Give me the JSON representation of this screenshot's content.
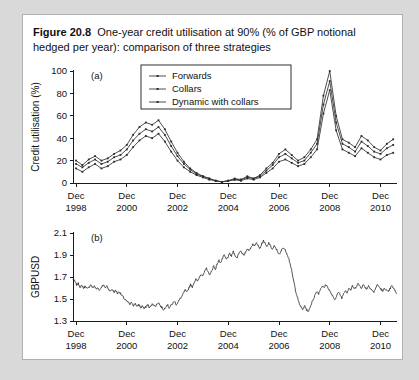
{
  "figure": {
    "label": "Figure 20.8",
    "caption": "One-year credit utilisation at 90% (% of GBP notional hedged per year): comparison of three strategies"
  },
  "chart_data": [
    {
      "type": "line",
      "panel_tag": "(a)",
      "title": "One-year credit utilisation at 90%",
      "xlabel": "",
      "ylabel": "Credit utilisation (%)",
      "ylim": [
        0,
        100
      ],
      "yticks": [
        0,
        20,
        40,
        60,
        80,
        100
      ],
      "xlim": [
        "Dec 1998",
        "Dec 2011"
      ],
      "xticks": [
        "Dec 1998",
        "Dec 2000",
        "Dec 2002",
        "Dec 2004",
        "Dec 2006",
        "Dec 2008",
        "Dec 2010"
      ],
      "xtick_years": [
        1998,
        2000,
        2002,
        2004,
        2006,
        2008,
        2010
      ],
      "grid": false,
      "legend_position": "upper-center",
      "markers": true,
      "x": [
        1998.95,
        1999.2,
        1999.45,
        1999.7,
        1999.95,
        2000.2,
        2000.45,
        2000.7,
        2000.95,
        2001.2,
        2001.45,
        2001.7,
        2001.95,
        2002.2,
        2002.45,
        2002.7,
        2002.95,
        2003.2,
        2003.45,
        2003.7,
        2003.95,
        2004.2,
        2004.45,
        2004.7,
        2004.95,
        2005.2,
        2005.45,
        2005.7,
        2005.95,
        2006.2,
        2006.45,
        2006.7,
        2006.95,
        2007.2,
        2007.45,
        2007.7,
        2007.95,
        2008.2,
        2008.45,
        2008.7,
        2008.95,
        2009.2,
        2009.45,
        2009.7,
        2009.95,
        2010.2,
        2010.45,
        2010.7,
        2010.95,
        2011.2,
        2011.45
      ],
      "series": [
        {
          "name": "Forwards",
          "values": [
            13,
            10,
            14,
            17,
            13,
            15,
            19,
            21,
            25,
            32,
            38,
            42,
            40,
            44,
            37,
            28,
            20,
            14,
            10,
            7,
            5,
            3,
            2,
            1,
            2,
            3,
            2,
            4,
            3,
            5,
            9,
            13,
            19,
            21,
            18,
            15,
            17,
            23,
            30,
            62,
            83,
            47,
            30,
            27,
            24,
            31,
            27,
            23,
            21,
            25,
            27
          ]
        },
        {
          "name": "Collars",
          "values": [
            17,
            14,
            18,
            21,
            17,
            19,
            23,
            25,
            30,
            38,
            44,
            48,
            46,
            50,
            43,
            33,
            24,
            17,
            12,
            8,
            6,
            4,
            2,
            1,
            2,
            3,
            3,
            5,
            4,
            6,
            11,
            16,
            23,
            26,
            22,
            18,
            20,
            27,
            35,
            70,
            91,
            54,
            35,
            32,
            28,
            37,
            33,
            28,
            26,
            31,
            34
          ]
        },
        {
          "name": "Dynamic with collars",
          "values": [
            20,
            16,
            21,
            24,
            20,
            22,
            26,
            29,
            34,
            43,
            50,
            54,
            52,
            56,
            48,
            37,
            27,
            19,
            13,
            9,
            6,
            4,
            2,
            1,
            2,
            4,
            3,
            6,
            4,
            7,
            13,
            18,
            26,
            30,
            25,
            20,
            23,
            30,
            39,
            78,
            100,
            60,
            39,
            36,
            32,
            42,
            38,
            32,
            29,
            35,
            39
          ]
        }
      ]
    },
    {
      "type": "line",
      "panel_tag": "(b)",
      "title": "",
      "xlabel": "",
      "ylabel": "GBPUSD",
      "ylim": [
        1.3,
        2.1
      ],
      "yticks": [
        1.3,
        1.5,
        1.7,
        1.9,
        2.1
      ],
      "xlim": [
        "Dec 1998",
        "Dec 2011"
      ],
      "xticks": [
        "Dec 1998",
        "Dec 2000",
        "Dec 2002",
        "Dec 2004",
        "Dec 2006",
        "Dec 2008",
        "Dec 2010"
      ],
      "xtick_years": [
        1998,
        2000,
        2002,
        2004,
        2006,
        2008,
        2010
      ],
      "grid": false,
      "markers": false,
      "series": [
        {
          "name": "GBPUSD",
          "values": [
            1.68,
            1.66,
            1.63,
            1.64,
            1.61,
            1.62,
            1.6,
            1.62,
            1.59,
            1.61,
            1.63,
            1.6,
            1.62,
            1.59,
            1.6,
            1.58,
            1.61,
            1.63,
            1.6,
            1.62,
            1.59,
            1.57,
            1.59,
            1.56,
            1.58,
            1.55,
            1.57,
            1.54,
            1.52,
            1.5,
            1.48,
            1.47,
            1.45,
            1.47,
            1.44,
            1.46,
            1.43,
            1.45,
            1.42,
            1.44,
            1.41,
            1.43,
            1.45,
            1.42,
            1.44,
            1.46,
            1.43,
            1.45,
            1.47,
            1.44,
            1.42,
            1.4,
            1.43,
            1.45,
            1.42,
            1.44,
            1.46,
            1.48,
            1.45,
            1.47,
            1.5,
            1.52,
            1.55,
            1.58,
            1.56,
            1.6,
            1.63,
            1.61,
            1.65,
            1.68,
            1.66,
            1.7,
            1.73,
            1.71,
            1.75,
            1.78,
            1.74,
            1.72,
            1.76,
            1.8,
            1.77,
            1.82,
            1.85,
            1.83,
            1.87,
            1.9,
            1.86,
            1.88,
            1.91,
            1.89,
            1.93,
            1.9,
            1.87,
            1.91,
            1.94,
            1.92,
            1.89,
            1.93,
            1.96,
            1.94,
            1.97,
            2.0,
            1.98,
            2.02,
            1.99,
            1.96,
            2.0,
            2.03,
            2.0,
            1.97,
            2.01,
            1.98,
            1.95,
            1.98,
            1.96,
            1.93,
            1.9,
            1.94,
            1.97,
            1.95,
            1.92,
            1.88,
            1.82,
            1.74,
            1.66,
            1.58,
            1.52,
            1.46,
            1.43,
            1.4,
            1.44,
            1.41,
            1.38,
            1.42,
            1.46,
            1.5,
            1.54,
            1.57,
            1.55,
            1.59,
            1.62,
            1.6,
            1.63,
            1.61,
            1.58,
            1.55,
            1.52,
            1.49,
            1.53,
            1.56,
            1.54,
            1.51,
            1.55,
            1.58,
            1.56,
            1.6,
            1.58,
            1.62,
            1.59,
            1.61,
            1.64,
            1.62,
            1.6,
            1.63,
            1.61,
            1.59,
            1.62,
            1.6,
            1.58,
            1.56,
            1.6,
            1.63,
            1.61,
            1.59,
            1.57,
            1.6,
            1.58,
            1.56,
            1.59,
            1.62,
            1.6,
            1.57,
            1.55
          ]
        }
      ]
    }
  ]
}
